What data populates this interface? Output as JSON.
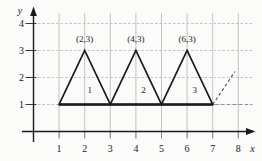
{
  "figure": {
    "colors": {
      "background": "#fbfbfa",
      "ink": "#1a1a1a",
      "grid": "#b5b5b5",
      "dash_dark": "#4a4a4a",
      "dash_light": "#8c8c8c"
    },
    "axes": {
      "x_label": "x",
      "y_label": "y",
      "x_ticks": [
        "1",
        "2",
        "3",
        "4",
        "5",
        "6",
        "7",
        "8"
      ],
      "y_ticks": [
        "1",
        "2",
        "3",
        "4"
      ],
      "x_range": [
        0,
        8
      ],
      "y_range": [
        0,
        4
      ],
      "grid": "on"
    },
    "triangles": [
      {
        "number": "1",
        "vertices": [
          [
            1,
            1
          ],
          [
            3,
            1
          ],
          [
            2,
            3
          ]
        ],
        "apex_label": "(2,3)",
        "apex_label_pos": [
          2,
          3.42
        ],
        "number_pos": [
          2.2,
          1.55
        ]
      },
      {
        "number": "2",
        "vertices": [
          [
            3,
            1
          ],
          [
            5,
            1
          ],
          [
            4,
            3
          ]
        ],
        "apex_label": "(4,3)",
        "apex_label_pos": [
          4,
          3.42
        ],
        "number_pos": [
          4.3,
          1.55
        ]
      },
      {
        "number": "3",
        "vertices": [
          [
            5,
            1
          ],
          [
            7,
            1
          ],
          [
            6,
            3
          ]
        ],
        "apex_label": "(6,3)",
        "apex_label_pos": [
          6,
          3.42
        ],
        "number_pos": [
          6.3,
          1.55
        ]
      }
    ],
    "base_segment": [
      [
        1,
        1
      ],
      [
        7,
        1
      ]
    ],
    "dashed_diagonal": [
      [
        7,
        1
      ],
      [
        7.87,
        2.22
      ]
    ],
    "dashed_horizontal": [
      [
        7.08,
        1
      ],
      [
        8.55,
        1
      ]
    ]
  },
  "chart_data": {
    "type": "scatter",
    "title": "",
    "xlabel": "x",
    "ylabel": "y",
    "xlim": [
      0,
      8
    ],
    "ylim": [
      0,
      4
    ],
    "x_tick_labels": [
      "1",
      "2",
      "3",
      "4",
      "5",
      "6",
      "7",
      "8"
    ],
    "y_tick_labels": [
      "1",
      "2",
      "3",
      "4"
    ],
    "series": [
      {
        "name": "triangle 1 outline",
        "x": [
          1,
          2,
          3,
          1
        ],
        "y": [
          1,
          3,
          1,
          1
        ]
      },
      {
        "name": "triangle 2 outline",
        "x": [
          3,
          4,
          5,
          3
        ],
        "y": [
          1,
          3,
          1,
          1
        ]
      },
      {
        "name": "triangle 3 outline",
        "x": [
          5,
          6,
          7,
          5
        ],
        "y": [
          1,
          3,
          1,
          1
        ]
      },
      {
        "name": "dashed continuation",
        "x": [
          7,
          7.87
        ],
        "y": [
          1,
          2.22
        ]
      }
    ],
    "annotations": [
      "(2,3)",
      "(4,3)",
      "(6,3)",
      "1",
      "2",
      "3"
    ],
    "legend_position": "none",
    "grid_on": true
  }
}
